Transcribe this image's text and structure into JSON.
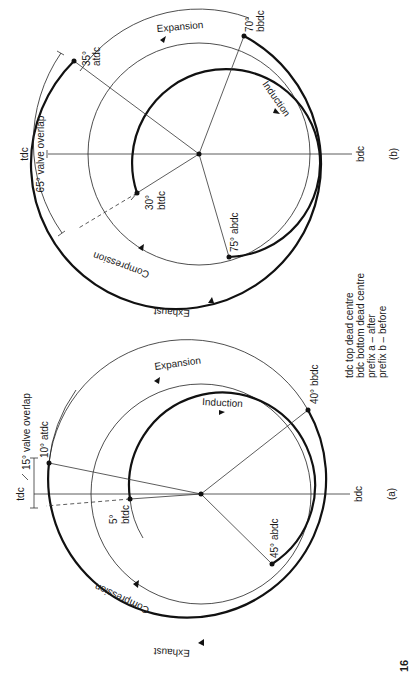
{
  "page": {
    "number": "16"
  },
  "legend": {
    "lines": [
      "tdc top dead centre",
      "bdc bottom dead centre",
      "prefix a – after",
      "prefix b – before"
    ]
  },
  "diagrams": [
    {
      "id": "a",
      "figure_label": "(a)",
      "tdc_label": "tdc",
      "bdc_label": "bdc",
      "overlap_label": "15° valve overlap",
      "phases": {
        "induction": "Induction",
        "compression": "Compression",
        "expansion": "Expansion",
        "exhaust": "Exhaust"
      },
      "timing": {
        "inlet_opens": {
          "deg": "5°",
          "ref": "btdc"
        },
        "inlet_closes": {
          "deg": "45°",
          "ref": "abdc",
          "text": "45° abdc"
        },
        "exhaust_opens": {
          "deg": "40°",
          "ref": "bbdc",
          "text": "40° bbdc"
        },
        "exhaust_closes": {
          "deg": "10°",
          "ref": "atdc",
          "text": "10° atdc"
        }
      }
    },
    {
      "id": "b",
      "figure_label": "(b)",
      "tdc_label": "tdc",
      "bdc_label": "bdc",
      "overlap_label": "65° valve overlap",
      "phases": {
        "induction": "Induction",
        "compression": "Compression",
        "expansion": "Expansion",
        "exhaust": "Exhaust"
      },
      "timing": {
        "inlet_opens": {
          "deg": "30°",
          "ref": "btdc"
        },
        "inlet_closes": {
          "deg": "75°",
          "ref": "abdc",
          "text": "75° abdc"
        },
        "exhaust_opens": {
          "deg": "70°",
          "ref": "bbdc"
        },
        "exhaust_closes": {
          "deg": "35°",
          "ref": "atdc"
        }
      }
    }
  ]
}
